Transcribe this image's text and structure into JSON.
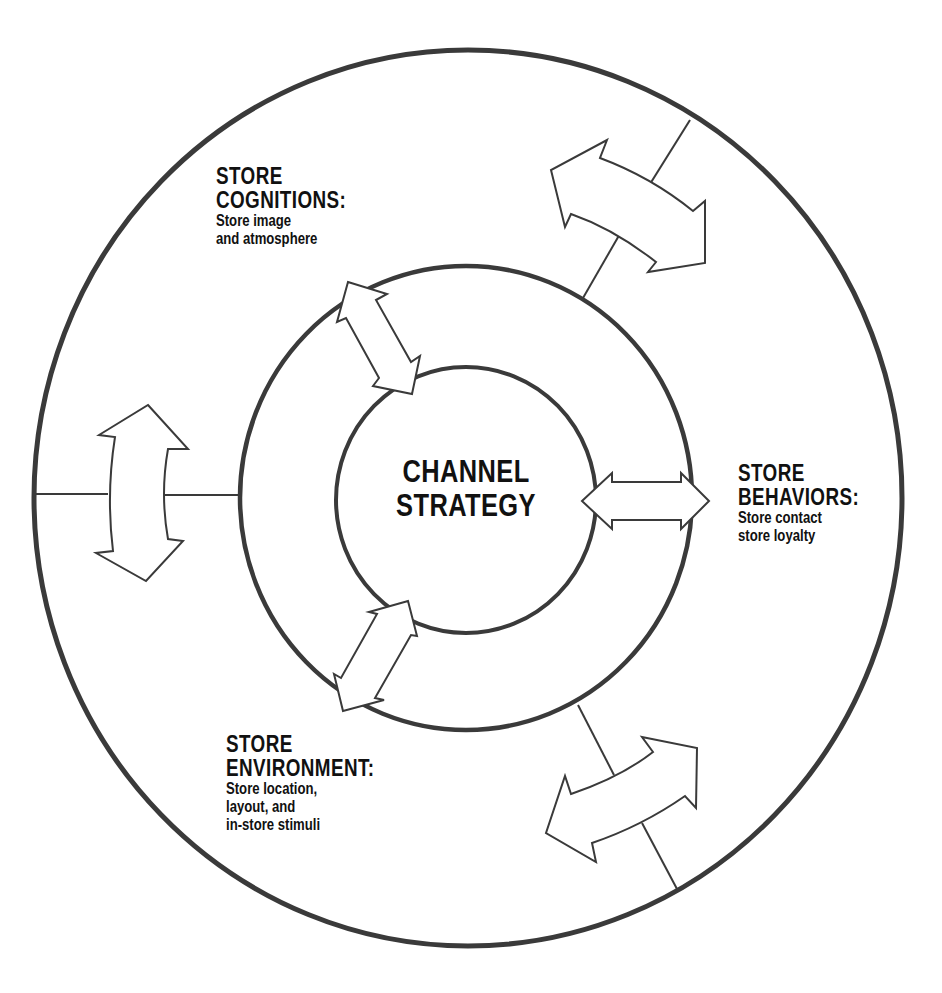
{
  "diagram": {
    "center": {
      "line1": "CHANNEL",
      "line2": "STRATEGY"
    },
    "nodes": [
      {
        "id": "cognitions",
        "title_line1": "STORE",
        "title_line2": "COGNITIONS:",
        "desc_lines": [
          "Store image",
          "and atmosphere"
        ]
      },
      {
        "id": "behaviors",
        "title_line1": "STORE",
        "title_line2": "BEHAVIORS:",
        "desc_lines": [
          "Store contact",
          "store loyalty"
        ]
      },
      {
        "id": "environment",
        "title_line1": "STORE",
        "title_line2": "ENVIRONMENT:",
        "desc_lines": [
          "Store location,",
          "layout, and",
          "in-store stimuli"
        ]
      }
    ],
    "rings": [
      "outer",
      "middle",
      "inner"
    ],
    "icons": {
      "arrows": [
        "double-arrow-icon"
      ]
    },
    "colors": {
      "stroke": "#3a3a3a",
      "text": "#111111",
      "background": "#ffffff"
    }
  }
}
